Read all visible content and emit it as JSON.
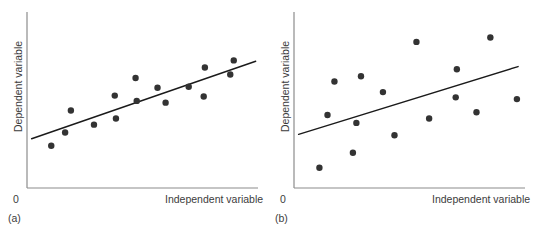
{
  "figure": {
    "background": "#ffffff",
    "axis_color": "#8c8c8c",
    "point_color": "#333333",
    "line_color": "#1a1a1a",
    "point_radius": 3.2,
    "axis": {
      "x_start": 27,
      "x_end": 258,
      "y_top": 12,
      "y_bottom": 188
    }
  },
  "chart_data": [
    {
      "type": "scatter",
      "id": "panel-a",
      "caption": "(a)",
      "title": "",
      "xlabel": "Independent variable",
      "ylabel": "Dependent variable",
      "origin_label": "0",
      "grid": false,
      "legend": "none",
      "xlim": [
        0,
        100
      ],
      "ylim": [
        0,
        100
      ],
      "relationship": "strong positive linear correlation",
      "points": [
        {
          "x": 10.5,
          "y": 24.0
        },
        {
          "x": 16.5,
          "y": 31.5
        },
        {
          "x": 19.0,
          "y": 44.0
        },
        {
          "x": 29.0,
          "y": 36.0
        },
        {
          "x": 38.5,
          "y": 39.5
        },
        {
          "x": 38.0,
          "y": 52.5
        },
        {
          "x": 47.0,
          "y": 62.5
        },
        {
          "x": 47.5,
          "y": 49.5
        },
        {
          "x": 56.5,
          "y": 57.0
        },
        {
          "x": 60.0,
          "y": 48.5
        },
        {
          "x": 70.0,
          "y": 57.5
        },
        {
          "x": 76.5,
          "y": 52.0
        },
        {
          "x": 77.0,
          "y": 68.5
        },
        {
          "x": 88.0,
          "y": 64.5
        },
        {
          "x": 89.5,
          "y": 72.5
        }
      ],
      "trendline": {
        "x_start": 2.0,
        "y_start": 28.0,
        "x_end": 99.0,
        "y_end": 72.0
      }
    },
    {
      "type": "scatter",
      "id": "panel-b",
      "caption": "(b)",
      "title": "",
      "xlabel": "Independent variable",
      "ylabel": "Dependent variable",
      "origin_label": "0",
      "grid": false,
      "legend": "none",
      "xlim": [
        0,
        100
      ],
      "ylim": [
        0,
        100
      ],
      "relationship": "weak positive linear correlation",
      "points": [
        {
          "x": 11.0,
          "y": 11.5
        },
        {
          "x": 14.5,
          "y": 41.5
        },
        {
          "x": 17.5,
          "y": 60.5
        },
        {
          "x": 25.5,
          "y": 20.0
        },
        {
          "x": 27.0,
          "y": 37.0
        },
        {
          "x": 29.0,
          "y": 63.5
        },
        {
          "x": 38.5,
          "y": 54.5
        },
        {
          "x": 43.5,
          "y": 30.0
        },
        {
          "x": 53.0,
          "y": 83.0
        },
        {
          "x": 58.5,
          "y": 39.5
        },
        {
          "x": 70.5,
          "y": 67.5
        },
        {
          "x": 70.0,
          "y": 51.5
        },
        {
          "x": 79.0,
          "y": 43.0
        },
        {
          "x": 85.0,
          "y": 85.5
        },
        {
          "x": 96.5,
          "y": 50.5
        }
      ],
      "trendline": {
        "x_start": 2.0,
        "y_start": 30.5,
        "x_end": 97.0,
        "y_end": 69.0
      }
    }
  ]
}
